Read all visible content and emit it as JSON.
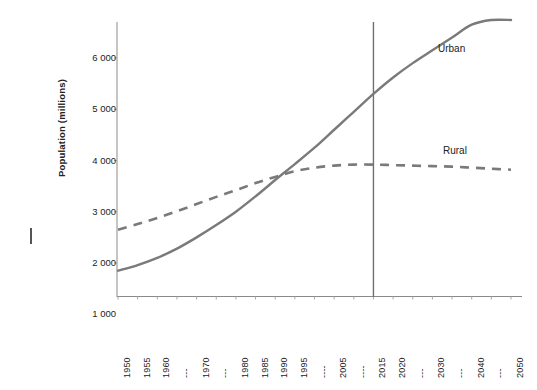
{
  "chart_data": {
    "type": "line",
    "title": "",
    "xlabel": "",
    "ylabel": "Population (millions)",
    "xlim": [
      1950,
      2050
    ],
    "ylim": [
      1000,
      6600
    ],
    "grid": false,
    "legend_position": "inline-right",
    "y_ticks": [
      "6 000",
      "5 000",
      "4 000",
      "3 000",
      "2 000",
      "1 000"
    ],
    "y_tick_values": [
      6000,
      5000,
      4000,
      3000,
      2000,
      1000
    ],
    "x_tick_labels": [
      "1950",
      "1955",
      "1960",
      "---",
      "1970",
      "---",
      "1980",
      "1985",
      "1990",
      "1995",
      "----",
      "2005",
      "----",
      "2015",
      "2020",
      "---",
      "2030",
      "---",
      "2040",
      "---",
      "2050"
    ],
    "x_tick_values": [
      1950,
      1955,
      1960,
      1965,
      1970,
      1975,
      1980,
      1985,
      1990,
      1995,
      2000,
      2005,
      2010,
      2015,
      2020,
      2025,
      2030,
      2035,
      2040,
      2045,
      2050
    ],
    "annotations": [
      {
        "name": "present-year-marker",
        "type": "vline",
        "x": 2015,
        "label": ""
      }
    ],
    "x": [
      1950,
      1955,
      1960,
      1965,
      1970,
      1975,
      1980,
      1985,
      1990,
      1995,
      2000,
      2005,
      2010,
      2015,
      2020,
      2025,
      2030,
      2035,
      2040,
      2045,
      2050
    ],
    "series": [
      {
        "name": "Urban",
        "label": "Urban",
        "style": "solid",
        "color": "#7a7a7a",
        "values": [
          1850,
          1960,
          2100,
          2280,
          2500,
          2740,
          3000,
          3300,
          3620,
          3930,
          4250,
          4600,
          4950,
          5300,
          5620,
          5900,
          6150,
          6400,
          6650,
          6900,
          7150
        ]
      },
      {
        "name": "Rural",
        "label": "Rural",
        "style": "dashed",
        "color": "#7a7a7a",
        "values": [
          2650,
          2760,
          2880,
          3010,
          3150,
          3290,
          3420,
          3560,
          3680,
          3790,
          3860,
          3900,
          3920,
          3920,
          3910,
          3900,
          3890,
          3880,
          3860,
          3840,
          3820
        ]
      }
    ]
  },
  "axes": {
    "y_title": "Population (millions)"
  },
  "labels": {
    "urban": "Urban",
    "rural": "Rural"
  }
}
